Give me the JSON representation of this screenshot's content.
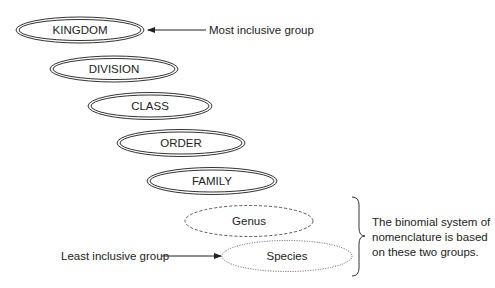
{
  "diagram": {
    "levels": [
      {
        "label": "KINGDOM",
        "style": "double",
        "cx": 80,
        "cy": 30
      },
      {
        "label": "DIVISION",
        "style": "double",
        "cx": 114,
        "cy": 69
      },
      {
        "label": "CLASS",
        "style": "double",
        "cx": 150,
        "cy": 106
      },
      {
        "label": "ORDER",
        "style": "double",
        "cx": 181,
        "cy": 143
      },
      {
        "label": "FAMILY",
        "style": "double",
        "cx": 212,
        "cy": 181
      },
      {
        "label": "Genus",
        "style": "dashed",
        "cx": 249,
        "cy": 221
      },
      {
        "label": "Species",
        "style": "dotted",
        "cx": 287,
        "cy": 256
      }
    ],
    "annotations": {
      "most_inclusive": "Most inclusive group",
      "least_inclusive": "Least inclusive group",
      "binomial_note": [
        "The binomial system of",
        "nomenclature is based",
        "on these two groups."
      ]
    },
    "colors": {
      "stroke": "#333333",
      "text": "#222222",
      "background": "#ffffff"
    }
  }
}
